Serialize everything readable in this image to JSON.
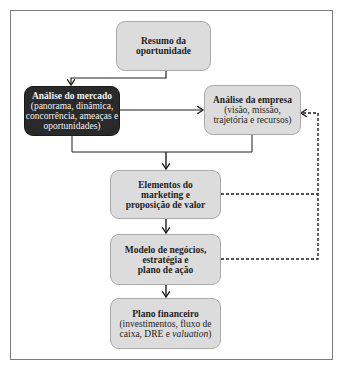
{
  "diagram": {
    "nodes": [
      {
        "id": "resumo",
        "title": "Resumo da oportunidade",
        "lines": [
          "Resumo da",
          "oportunidade"
        ],
        "subtitle": ""
      },
      {
        "id": "mercado",
        "title": "Análise do mercado",
        "subtitle_lines": [
          "(panorama, dinâmica,",
          "concorrência, ameaças e",
          "oportunidades)"
        ],
        "style": "dark"
      },
      {
        "id": "empresa",
        "title": "Análise da empresa",
        "subtitle_lines": [
          "(visão, missão,",
          "trajetória e recursos)"
        ]
      },
      {
        "id": "elementos",
        "lines": [
          "Elementos do",
          "marketing e",
          "proposição de valor"
        ]
      },
      {
        "id": "modelo",
        "lines": [
          "Modelo de negócios,",
          "estratégia e",
          "plano de ação"
        ]
      },
      {
        "id": "plano",
        "title": "Plano financeiro",
        "subtitle_lines": [
          "(investimentos, fluxo de",
          "caixa, DRE e "
        ],
        "subtitle_italic": "valuation",
        "subtitle_end": ")"
      }
    ],
    "edges": [
      {
        "from": "resumo",
        "to": "mercado",
        "style": "solid"
      },
      {
        "from": "mercado",
        "to": "empresa",
        "style": "solid"
      },
      {
        "from": "mercado",
        "to": "elementos",
        "style": "solid"
      },
      {
        "from": "empresa",
        "to": "elementos",
        "style": "solid"
      },
      {
        "from": "elementos",
        "to": "modelo",
        "style": "solid"
      },
      {
        "from": "modelo",
        "to": "plano",
        "style": "solid"
      },
      {
        "from": "elementos",
        "to": "empresa",
        "style": "dashed"
      },
      {
        "from": "modelo",
        "to": "empresa",
        "style": "dashed"
      }
    ],
    "colors": {
      "box_fill": "#dcdcdc",
      "dark_box_fill": "#2a2a2a",
      "line": "#1e1e1e",
      "frame": "#7a7a7a"
    }
  }
}
